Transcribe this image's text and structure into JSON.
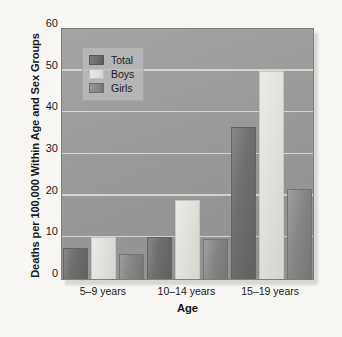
{
  "chart_data": {
    "type": "bar",
    "title": "",
    "xlabel": "Age",
    "ylabel": "Deaths per 100,000 Within Age and Sex Groups",
    "categories": [
      "5–9 years",
      "10–14 years",
      "15–19 years"
    ],
    "series": [
      {
        "name": "Total",
        "values": [
          7.5,
          10.0,
          36.5
        ],
        "color": "#6e6e6e"
      },
      {
        "name": "Boys",
        "values": [
          10.0,
          19.0,
          50.0
        ],
        "color": "#e2e0da"
      },
      {
        "name": "Girls",
        "values": [
          6.0,
          9.5,
          21.5
        ],
        "color": "#858585"
      }
    ],
    "ylim": [
      0,
      60
    ],
    "yticks": [
      0,
      10,
      20,
      30,
      40,
      50,
      60
    ],
    "ytick_labels": [
      "0",
      "10",
      "20",
      "30",
      "40",
      "50",
      "60"
    ],
    "grid": true,
    "grid_axis": "y",
    "legend_position": "upper left",
    "plot_background": "#9a9a9a",
    "figure_background": "#f7f6f3",
    "gridline_color": "#ddddd8"
  },
  "legend": {
    "entries": [
      {
        "label": "Total"
      },
      {
        "label": "Boys"
      },
      {
        "label": "Girls"
      }
    ]
  }
}
